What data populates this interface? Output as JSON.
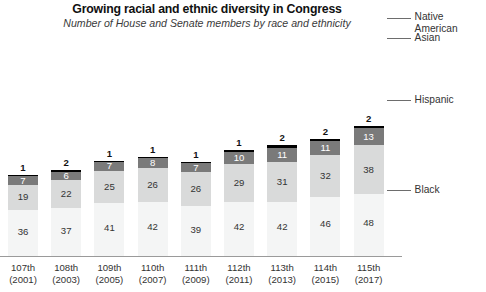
{
  "chart_data": {
    "type": "bar",
    "subtype": "stacked-vertical",
    "title": "Growing racial and ethnic diversity in Congress",
    "subtitle": "Number of House and Senate members by race and ethnicity",
    "xlabel": "",
    "ylabel": "",
    "grid": false,
    "legend_position": "right-callout",
    "categories": [
      "107th\n(2001)",
      "108th\n(2003)",
      "109th\n(2005)",
      "110th\n(2007)",
      "111th\n(2009)",
      "112th\n(2011)",
      "113th\n(2013)",
      "114th\n(2015)",
      "115th\n(2017)"
    ],
    "tick_labels": [
      {
        "congress": "107th",
        "year": "(2001)"
      },
      {
        "congress": "108th",
        "year": "(2003)"
      },
      {
        "congress": "109th",
        "year": "(2005)"
      },
      {
        "congress": "110th",
        "year": "(2007)"
      },
      {
        "congress": "111th",
        "year": "(2009)"
      },
      {
        "congress": "112th",
        "year": "(2011)"
      },
      {
        "congress": "113th",
        "year": "(2013)"
      },
      {
        "congress": "114th",
        "year": "(2015)"
      },
      {
        "congress": "115th",
        "year": "(2017)"
      }
    ],
    "series": [
      {
        "name": "Black",
        "color": "#f4f5f5",
        "values": [
          36,
          37,
          41,
          42,
          39,
          42,
          42,
          46,
          48
        ]
      },
      {
        "name": "Hispanic",
        "color": "#d9dada",
        "values": [
          19,
          22,
          25,
          26,
          26,
          29,
          31,
          32,
          38
        ]
      },
      {
        "name": "Asian",
        "color": "#7a7a7a",
        "values": [
          7,
          6,
          7,
          8,
          7,
          10,
          11,
          11,
          13
        ]
      },
      {
        "name": "Native American",
        "color": "#000000",
        "values": [
          1,
          2,
          1,
          1,
          1,
          1,
          2,
          2,
          2
        ]
      }
    ],
    "totals": [
      63,
      67,
      74,
      77,
      73,
      82,
      86,
      91,
      101
    ]
  },
  "legend": [
    {
      "label": "Native American",
      "color": "#000000"
    },
    {
      "label": "Asian",
      "color": "#7a7a7a"
    },
    {
      "label": "Hispanic",
      "color": "#d9dada"
    },
    {
      "label": "Black",
      "color": "#f4f5f5"
    }
  ],
  "colors": {
    "native_american": "#000000",
    "asian": "#7a7a7a",
    "hispanic": "#d9dada",
    "black": "#f4f5f5",
    "axis": "#9a9a9a",
    "text": "#333333"
  }
}
